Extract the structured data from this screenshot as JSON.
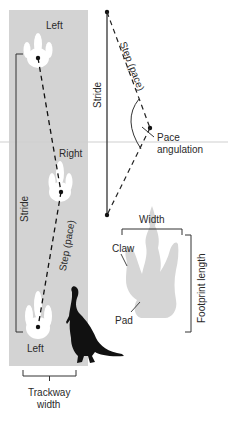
{
  "diagram": {
    "trackway_panel": {
      "background": "#d2d2d2",
      "footprints": [
        {
          "label": "Left",
          "position": "top"
        },
        {
          "label": "Right",
          "position": "middle"
        },
        {
          "label": "Left",
          "position": "bottom"
        }
      ],
      "stride_label": "Stride",
      "step_label": "Step (pace)",
      "trackway_width_label_line1": "Trackway",
      "trackway_width_label_line2": "width"
    },
    "angulation_diagram": {
      "stride_label": "Stride",
      "step_label": "Step (pace)",
      "pace_angulation_line1": "Pace",
      "pace_angulation_line2": "angulation"
    },
    "footprint_detail": {
      "width_label": "Width",
      "claw_label": "Claw",
      "pad_label": "Pad",
      "length_label": "Footprint length",
      "footprint_color": "#d4d4d4"
    }
  }
}
